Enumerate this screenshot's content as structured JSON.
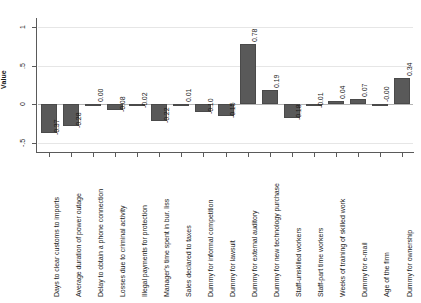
{
  "chart_data": {
    "type": "bar",
    "title": "",
    "xlabel": "",
    "ylabel": "Value",
    "ylim": [
      -0.62,
      1.12
    ],
    "grid": true,
    "legend": "none",
    "yticks": [
      "1",
      ".5",
      "0",
      "-.5"
    ],
    "ytick_values": [
      1,
      0.5,
      0,
      -0.5
    ],
    "bar_color": "#595959",
    "categories": [
      "Days to clear customs to imports",
      "Average duration of power outage",
      "Delay to obtain a phone connection",
      "Losses due to criminal activity",
      "Illegal payments for protection",
      "Manager's time spent in bur. liss",
      "Sales declared to taxes",
      "Dummy for informal competition",
      "Dummy for lawsuit",
      "Dummy for external auditory",
      "Dummy for new technology purchase",
      "Staff-unskilled workers",
      "Staff-part time workers",
      "Weeks of training of skilled work",
      "Dummy for e-mail",
      "Age of the firm",
      "Dummy for ownership"
    ],
    "values": [
      -0.37,
      -0.28,
      0.0,
      -0.08,
      -0.02,
      -0.22,
      0.01,
      -0.1,
      -0.15,
      0.78,
      0.19,
      -0.18,
      -0.01,
      0.04,
      0.07,
      -0.0,
      0.34
    ],
    "value_labels": [
      "-0.37",
      "-0.28",
      "0.00",
      "-0.08",
      "-0.02",
      "-0.22",
      "0.01",
      "-0.10",
      "-0.15",
      "0.78",
      "0.19",
      "-0.18",
      "-0.01",
      "0.04",
      "0.07",
      "-0.00",
      "0.34"
    ]
  }
}
